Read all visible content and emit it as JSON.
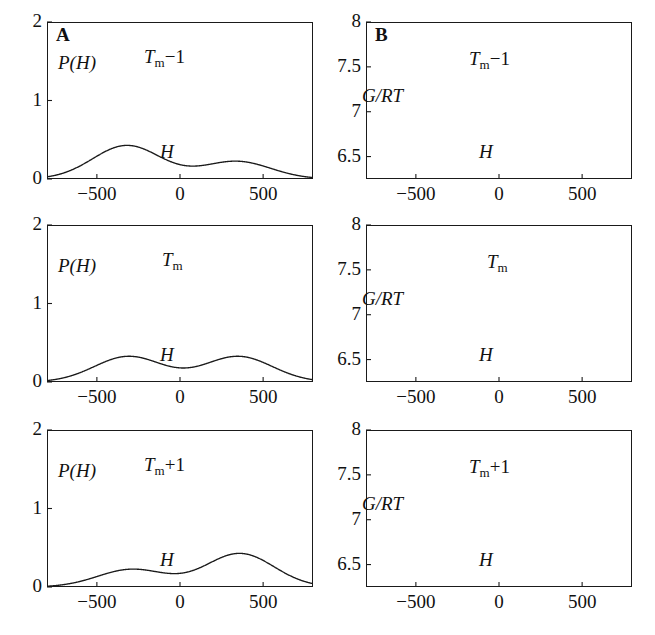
{
  "figure": {
    "panel_letters": [
      "A",
      "B"
    ],
    "rows": [
      "Tm-1",
      "Tm",
      "Tm+1"
    ]
  },
  "labels": {
    "p_of_h": "P(H)",
    "g_rt": "G/RT",
    "h_axis": "H",
    "tm_symbol": "T",
    "tm_sub": "m",
    "temp_minus": "−1",
    "temp_none": "",
    "temp_plus": "+1"
  },
  "axes": {
    "x_ticks": [
      "−500",
      "0",
      "500"
    ],
    "x_tick_values": [
      -500,
      0,
      500
    ],
    "x_range": [
      -800,
      800
    ],
    "left_y_ticks": [
      "2",
      "1",
      "0"
    ],
    "left_y_tick_values": [
      2,
      1,
      0
    ],
    "left_y_range": [
      0,
      2
    ],
    "right_y_ticks": [
      "8",
      "7.5",
      "7",
      "6.5"
    ],
    "right_y_tick_values": [
      8,
      7.5,
      7,
      6.5
    ],
    "right_y_range": [
      6.25,
      8.0
    ]
  },
  "colors": {
    "curve": "#1a1a1a",
    "frame": "#1a1a1a",
    "background": "#ffffff",
    "text": "#111111"
  },
  "chart_data": [
    {
      "type": "line",
      "id": "A-Tm-minus-1",
      "panel": "A",
      "title": "Tm-1",
      "xlabel": "H",
      "ylabel": "P(H)",
      "xlim": [
        -800,
        800
      ],
      "ylim": [
        0,
        2
      ],
      "grid": false,
      "legend": "none",
      "description": "Bimodal enthalpy distribution, low-enthalpy (folded) peak dominant",
      "peaks": [
        {
          "x": -320,
          "y": 1.63,
          "label": "major peak"
        },
        {
          "x": 340,
          "y": 0.8,
          "label": "minor peak"
        }
      ],
      "minima": [
        {
          "x": 110,
          "y": 0.66
        }
      ],
      "mixture": [
        {
          "weight": 0.655,
          "mean": -320,
          "sigma": 205
        },
        {
          "weight": 0.345,
          "mean": 340,
          "sigma": 205
        }
      ]
    },
    {
      "type": "line",
      "id": "B-Tm-minus-1",
      "panel": "B",
      "title": "Tm-1",
      "xlabel": "H",
      "ylabel": "G/RT",
      "xlim": [
        -800,
        800
      ],
      "ylim": [
        6.25,
        8.0
      ],
      "grid": false,
      "legend": "none",
      "description": "Asymmetric double-well free energy, deep left well",
      "minima": [
        {
          "x": -320,
          "y": 6.43
        },
        {
          "x": 340,
          "y": 7.12
        }
      ],
      "maxima": [
        {
          "x": 90,
          "y": 7.34
        }
      ],
      "mixture": [
        {
          "weight": 0.655,
          "mean": -320,
          "sigma": 205
        },
        {
          "weight": 0.345,
          "mean": 340,
          "sigma": 205
        }
      ],
      "offset": 7.93
    },
    {
      "type": "line",
      "id": "A-Tm",
      "panel": "A",
      "title": "Tm",
      "xlabel": "H",
      "ylabel": "P(H)",
      "xlim": [
        -800,
        800
      ],
      "ylim": [
        0,
        2
      ],
      "grid": false,
      "legend": "none",
      "description": "Symmetric bimodal enthalpy distribution at melting temperature",
      "peaks": [
        {
          "x": -310,
          "y": 1.23,
          "label": "left peak"
        },
        {
          "x": 350,
          "y": 1.21,
          "label": "right peak"
        }
      ],
      "minima": [
        {
          "x": 15,
          "y": 0.7
        }
      ],
      "mixture": [
        {
          "weight": 0.5,
          "mean": -310,
          "sigma": 205
        },
        {
          "weight": 0.5,
          "mean": 350,
          "sigma": 205
        }
      ]
    },
    {
      "type": "line",
      "id": "B-Tm",
      "panel": "B",
      "title": "Tm",
      "xlabel": "H",
      "ylabel": "G/RT",
      "xlim": [
        -800,
        800
      ],
      "ylim": [
        6.25,
        8.0
      ],
      "grid": false,
      "legend": "none",
      "description": "Symmetric double-well free energy with equal minima",
      "minima": [
        {
          "x": -310,
          "y": 6.67
        },
        {
          "x": 350,
          "y": 6.68
        }
      ],
      "maxima": [
        {
          "x": 15,
          "y": 7.25
        }
      ],
      "mixture": [
        {
          "weight": 0.5,
          "mean": -310,
          "sigma": 205
        },
        {
          "weight": 0.5,
          "mean": 350,
          "sigma": 205
        }
      ],
      "offset": 7.88
    },
    {
      "type": "line",
      "id": "A-Tm-plus-1",
      "panel": "A",
      "title": "Tm+1",
      "xlabel": "H",
      "ylabel": "P(H)",
      "xlim": [
        -800,
        800
      ],
      "ylim": [
        0,
        2
      ],
      "grid": false,
      "legend": "none",
      "description": "Bimodal enthalpy distribution, high-enthalpy (unfolded) peak dominant",
      "peaks": [
        {
          "x": -290,
          "y": 0.85,
          "label": "minor peak"
        },
        {
          "x": 360,
          "y": 1.62,
          "label": "major peak"
        }
      ],
      "minima": [
        {
          "x": -60,
          "y": 0.66
        }
      ],
      "mixture": [
        {
          "weight": 0.345,
          "mean": -290,
          "sigma": 205
        },
        {
          "weight": 0.655,
          "mean": 360,
          "sigma": 205
        }
      ]
    },
    {
      "type": "line",
      "id": "B-Tm-plus-1",
      "panel": "B",
      "title": "Tm+1",
      "xlabel": "H",
      "ylabel": "G/RT",
      "xlim": [
        -800,
        800
      ],
      "ylim": [
        6.25,
        8.0
      ],
      "grid": false,
      "legend": "none",
      "description": "Asymmetric double-well free energy, deep right well",
      "minima": [
        {
          "x": -290,
          "y": 7.0
        },
        {
          "x": 360,
          "y": 6.4
        }
      ],
      "maxima": [
        {
          "x": -45,
          "y": 7.3
        }
      ],
      "mixture": [
        {
          "weight": 0.345,
          "mean": -290,
          "sigma": 205
        },
        {
          "weight": 0.655,
          "mean": 360,
          "sigma": 205
        }
      ],
      "offset": 7.9
    }
  ]
}
